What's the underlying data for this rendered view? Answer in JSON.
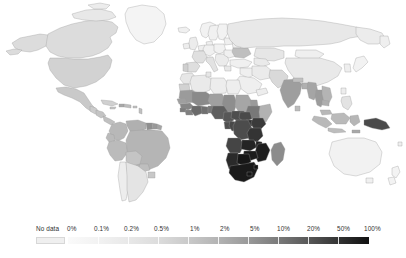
{
  "figure": {
    "type": "choropleth-world-map",
    "title": "",
    "background_color": "#ffffff",
    "map_border_color": "#9a9a9a",
    "no_data_color": "#efefef"
  },
  "legend": {
    "no_data_label": "No data",
    "labels": [
      {
        "text": "0%",
        "x": 68
      },
      {
        "text": "0.1%",
        "x": 98
      },
      {
        "text": "0.2%",
        "x": 128
      },
      {
        "text": "0.5%",
        "x": 158
      },
      {
        "text": "1%",
        "x": 191
      },
      {
        "text": "2%",
        "x": 221
      },
      {
        "text": "5%",
        "x": 251
      },
      {
        "text": "10%",
        "x": 279
      },
      {
        "text": "20%",
        "x": 309
      },
      {
        "text": "50%",
        "x": 339
      },
      {
        "text": "100%",
        "x": 366
      }
    ],
    "stops": [
      {
        "label": "0%",
        "color": "#fafafa"
      },
      {
        "label": "0.1%",
        "color": "#f2f2f2"
      },
      {
        "label": "0.2%",
        "color": "#e8e8e8"
      },
      {
        "label": "0.5%",
        "color": "#dcdcdc"
      },
      {
        "label": "1%",
        "color": "#c9c9c9"
      },
      {
        "label": "2%",
        "color": "#b3b3b3"
      },
      {
        "label": "5%",
        "color": "#999999"
      },
      {
        "label": "10%",
        "color": "#7a7a7a"
      },
      {
        "label": "20%",
        "color": "#585858"
      },
      {
        "label": "50%",
        "color": "#333333"
      },
      {
        "label": "100%",
        "color": "#111111"
      }
    ]
  },
  "chart_data": {
    "type": "heatmap",
    "title": "",
    "xlabel": "",
    "ylabel": "",
    "legend_position": "bottom",
    "scale": "log",
    "unit": "percent",
    "tick_labels": [
      "0%",
      "0.1%",
      "0.2%",
      "0.5%",
      "1%",
      "2%",
      "5%",
      "10%",
      "20%",
      "50%",
      "100%"
    ],
    "no_data_label": "No data",
    "regions": [
      {
        "name": "Canada",
        "value": "0.2%",
        "color": "#dcdcdc"
      },
      {
        "name": "United States",
        "value": "0.5%",
        "color": "#d2d2d2"
      },
      {
        "name": "Greenland",
        "value": "0.1%",
        "color": "#f4f4f4"
      },
      {
        "name": "Mexico",
        "value": "0.5%",
        "color": "#c9c9c9"
      },
      {
        "name": "Guatemala",
        "value": "0.5%",
        "color": "#cccccc"
      },
      {
        "name": "Cuba",
        "value": "0.5%",
        "color": "#d0d0d0"
      },
      {
        "name": "Haiti",
        "value": "2%",
        "color": "#a8a8a8"
      },
      {
        "name": "Dominican Republic",
        "value": "1%",
        "color": "#bdbdbd"
      },
      {
        "name": "Colombia",
        "value": "0.5%",
        "color": "#b8b8b8"
      },
      {
        "name": "Venezuela",
        "value": "0.5%",
        "color": "#b0b0b0"
      },
      {
        "name": "Guyana",
        "value": "1%",
        "color": "#8f8f8f"
      },
      {
        "name": "Suriname",
        "value": "1%",
        "color": "#999999"
      },
      {
        "name": "Brazil",
        "value": "0.5%",
        "color": "#b5b5b5"
      },
      {
        "name": "Peru",
        "value": "0.5%",
        "color": "#bbbbbb"
      },
      {
        "name": "Bolivia",
        "value": "0.2%",
        "color": "#c4c4c4"
      },
      {
        "name": "Ecuador",
        "value": "0.5%",
        "color": "#bababa"
      },
      {
        "name": "Paraguay",
        "value": "0.5%",
        "color": "#bebebe"
      },
      {
        "name": "Chile",
        "value": "0.1%",
        "color": "#ededed"
      },
      {
        "name": "Argentina",
        "value": "0.2%",
        "color": "#e4e4e4"
      },
      {
        "name": "Uruguay",
        "value": "0.5%",
        "color": "#c8c8c8"
      },
      {
        "name": "United Kingdom",
        "value": "0.1%",
        "color": "#ececec"
      },
      {
        "name": "Ireland",
        "value": "0.1%",
        "color": "#ededed"
      },
      {
        "name": "France",
        "value": "0.2%",
        "color": "#e0e0e0"
      },
      {
        "name": "Spain",
        "value": "0.2%",
        "color": "#dedede"
      },
      {
        "name": "Portugal",
        "value": "0.5%",
        "color": "#cfcfcf"
      },
      {
        "name": "Germany",
        "value": "0.1%",
        "color": "#f0f0f0"
      },
      {
        "name": "Italy",
        "value": "0.2%",
        "color": "#e2e2e2"
      },
      {
        "name": "Poland",
        "value": "0.1%",
        "color": "#f1f1f1"
      },
      {
        "name": "Ukraine",
        "value": "1%",
        "color": "#bfbfbf"
      },
      {
        "name": "Russia",
        "value": "0.5%",
        "color": "#e8e8e8"
      },
      {
        "name": "Scandinavia",
        "value": "0.1%",
        "color": "#f2f2f2"
      },
      {
        "name": "Turkey",
        "value": "0.1%",
        "color": "#f0f0f0"
      },
      {
        "name": "Iran",
        "value": "0.1%",
        "color": "#ebebeb"
      },
      {
        "name": "Saudi Arabia",
        "value": "No data",
        "color": "#efefef"
      },
      {
        "name": "Kazakhstan",
        "value": "0.2%",
        "color": "#e6e6e6"
      },
      {
        "name": "China",
        "value": "0.1%",
        "color": "#e9e9e9"
      },
      {
        "name": "Mongolia",
        "value": "0.1%",
        "color": "#efefef"
      },
      {
        "name": "Japan",
        "value": "0.1%",
        "color": "#f2f2f2"
      },
      {
        "name": "India",
        "value": "0.2%",
        "color": "#9e9e9e"
      },
      {
        "name": "Pakistan",
        "value": "0.1%",
        "color": "#d9d9d9"
      },
      {
        "name": "Nepal",
        "value": "0.2%",
        "color": "#c0c0c0"
      },
      {
        "name": "Myanmar",
        "value": "0.5%",
        "color": "#a5a5a5"
      },
      {
        "name": "Thailand",
        "value": "1%",
        "color": "#9c9c9c"
      },
      {
        "name": "Vietnam",
        "value": "0.5%",
        "color": "#b4b4b4"
      },
      {
        "name": "Cambodia",
        "value": "0.5%",
        "color": "#aeaeae"
      },
      {
        "name": "Malaysia",
        "value": "0.5%",
        "color": "#b8b8b8"
      },
      {
        "name": "Indonesia",
        "value": "0.5%",
        "color": "#b9b9b9"
      },
      {
        "name": "Philippines",
        "value": "0.1%",
        "color": "#e3e3e3"
      },
      {
        "name": "Papua New Guinea",
        "value": "1%",
        "color": "#4a4a4a"
      },
      {
        "name": "Australia",
        "value": "0.1%",
        "color": "#f2f2f2"
      },
      {
        "name": "New Zealand",
        "value": "0.1%",
        "color": "#f3f3f3"
      },
      {
        "name": "Morocco",
        "value": "0.1%",
        "color": "#e7e7e7"
      },
      {
        "name": "Algeria",
        "value": "0.1%",
        "color": "#eaeaea"
      },
      {
        "name": "Libya",
        "value": "0.1%",
        "color": "#ededed"
      },
      {
        "name": "Egypt",
        "value": "0.1%",
        "color": "#eeeeee"
      },
      {
        "name": "Mauritania",
        "value": "0.5%",
        "color": "#9b9b9b"
      },
      {
        "name": "Mali",
        "value": "1%",
        "color": "#8a8a8a"
      },
      {
        "name": "Niger",
        "value": "0.5%",
        "color": "#a0a0a0"
      },
      {
        "name": "Chad",
        "value": "1%",
        "color": "#8e8e8e"
      },
      {
        "name": "Sudan",
        "value": "0.5%",
        "color": "#a6a6a6"
      },
      {
        "name": "Senegal",
        "value": "0.5%",
        "color": "#9f9f9f"
      },
      {
        "name": "Guinea",
        "value": "1%",
        "color": "#868686"
      },
      {
        "name": "Sierra Leone",
        "value": "1%",
        "color": "#7d7d7d"
      },
      {
        "name": "Liberia",
        "value": "1%",
        "color": "#808080"
      },
      {
        "name": "Ivory Coast",
        "value": "2%",
        "color": "#6a6a6a"
      },
      {
        "name": "Ghana",
        "value": "2%",
        "color": "#707070"
      },
      {
        "name": "Nigeria",
        "value": "2%",
        "color": "#5e5e5e"
      },
      {
        "name": "Cameroon",
        "value": "2%",
        "color": "#575757"
      },
      {
        "name": "Central African Republic",
        "value": "2%",
        "color": "#4e4e4e"
      },
      {
        "name": "Ethiopia",
        "value": "1%",
        "color": "#787878"
      },
      {
        "name": "Somalia",
        "value": "0.5%",
        "color": "#b2b2b2"
      },
      {
        "name": "Kenya",
        "value": "5%",
        "color": "#3a3a3a"
      },
      {
        "name": "Uganda",
        "value": "5%",
        "color": "#303030"
      },
      {
        "name": "Tanzania",
        "value": "5%",
        "color": "#343434"
      },
      {
        "name": "DR Congo",
        "value": "2%",
        "color": "#4c4c4c"
      },
      {
        "name": "Congo",
        "value": "2%",
        "color": "#484848"
      },
      {
        "name": "Gabon",
        "value": "2%",
        "color": "#4f4f4f"
      },
      {
        "name": "Angola",
        "value": "2%",
        "color": "#454545"
      },
      {
        "name": "Zambia",
        "value": "10%",
        "color": "#242424"
      },
      {
        "name": "Malawi",
        "value": "10%",
        "color": "#202020"
      },
      {
        "name": "Mozambique",
        "value": "10%",
        "color": "#1e1e1e"
      },
      {
        "name": "Zimbabwe",
        "value": "10%",
        "color": "#1c1c1c"
      },
      {
        "name": "Botswana",
        "value": "20%",
        "color": "#171717"
      },
      {
        "name": "Namibia",
        "value": "10%",
        "color": "#2a2a2a"
      },
      {
        "name": "South Africa",
        "value": "20%",
        "color": "#1a1a1a"
      },
      {
        "name": "Lesotho",
        "value": "20%",
        "color": "#151515"
      },
      {
        "name": "Eswatini",
        "value": "20%",
        "color": "#131313"
      },
      {
        "name": "Madagascar",
        "value": "0.5%",
        "color": "#8c8c8c"
      },
      {
        "name": "Antarctica",
        "value": "No data",
        "color": "#ffffff"
      }
    ]
  }
}
